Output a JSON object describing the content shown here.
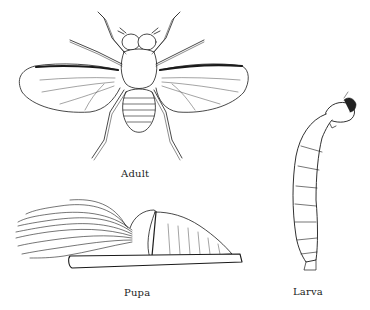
{
  "figure": {
    "stages": [
      {
        "id": "adult",
        "label": "Adult"
      },
      {
        "id": "pupa",
        "label": "Pupa"
      },
      {
        "id": "larva",
        "label": "Larva"
      }
    ]
  },
  "colors": {
    "background": "#ffffff",
    "ink": "#1a1a1a"
  }
}
